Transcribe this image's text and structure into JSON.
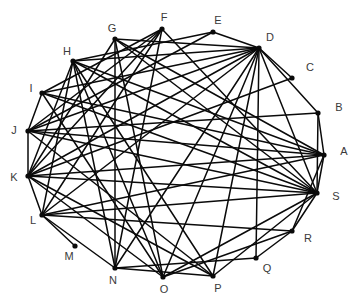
{
  "figure": {
    "title_fragment": "",
    "background_color": "#ffffff",
    "edge_color": "#0a0a0a",
    "node_color": "#0a0a0a",
    "label_color": "#3a3a3a"
  },
  "chart_data": {
    "type": "diagram",
    "subtype": "node-link-graph",
    "layout": "circular",
    "title": "",
    "xlabel": "",
    "ylabel": "",
    "grid": false,
    "legend": null,
    "node_count": 19,
    "edge_count": 60,
    "nodes": [
      {
        "id": "A",
        "label": "A",
        "x": 324,
        "y": 155,
        "label_x": 344,
        "label_y": 152
      },
      {
        "id": "B",
        "label": "B",
        "x": 318,
        "y": 113,
        "label_x": 339,
        "label_y": 108
      },
      {
        "id": "C",
        "label": "C",
        "x": 292,
        "y": 78,
        "label_x": 310,
        "label_y": 68
      },
      {
        "id": "D",
        "label": "D",
        "x": 259,
        "y": 48,
        "label_x": 270,
        "label_y": 38
      },
      {
        "id": "E",
        "label": "E",
        "x": 213,
        "y": 32,
        "label_x": 218,
        "label_y": 21
      },
      {
        "id": "F",
        "label": "F",
        "x": 162,
        "y": 29,
        "label_x": 164,
        "label_y": 18
      },
      {
        "id": "G",
        "label": "G",
        "x": 115,
        "y": 39,
        "label_x": 112,
        "label_y": 29
      },
      {
        "id": "H",
        "label": "H",
        "x": 73,
        "y": 61,
        "label_x": 67,
        "label_y": 52
      },
      {
        "id": "I",
        "label": "I",
        "x": 42,
        "y": 93,
        "label_x": 31,
        "label_y": 89
      },
      {
        "id": "J",
        "label": "J",
        "x": 28,
        "y": 131,
        "label_x": 14,
        "label_y": 131
      },
      {
        "id": "K",
        "label": "K",
        "x": 28,
        "y": 176,
        "label_x": 14,
        "label_y": 178
      },
      {
        "id": "L",
        "label": "L",
        "x": 42,
        "y": 215,
        "label_x": 33,
        "label_y": 221
      },
      {
        "id": "M",
        "label": "M",
        "x": 75,
        "y": 246,
        "label_x": 69,
        "label_y": 257
      },
      {
        "id": "N",
        "label": "N",
        "x": 115,
        "y": 268,
        "label_x": 113,
        "label_y": 281
      },
      {
        "id": "O",
        "label": "O",
        "x": 163,
        "y": 277,
        "label_x": 164,
        "label_y": 290
      },
      {
        "id": "P",
        "label": "P",
        "x": 213,
        "y": 276,
        "label_x": 218,
        "label_y": 289
      },
      {
        "id": "Q",
        "label": "Q",
        "x": 256,
        "y": 258,
        "label_x": 267,
        "label_y": 269
      },
      {
        "id": "R",
        "label": "R",
        "x": 292,
        "y": 231,
        "label_x": 308,
        "label_y": 239
      },
      {
        "id": "S",
        "label": "S",
        "x": 317,
        "y": 193,
        "label_x": 336,
        "label_y": 197
      }
    ],
    "edges": [
      [
        "A",
        "B"
      ],
      [
        "A",
        "S"
      ],
      [
        "A",
        "K"
      ],
      [
        "A",
        "J"
      ],
      [
        "A",
        "H"
      ],
      [
        "A",
        "G"
      ],
      [
        "A",
        "I"
      ],
      [
        "A",
        "L"
      ],
      [
        "A",
        "R"
      ],
      [
        "B",
        "S"
      ],
      [
        "B",
        "D"
      ],
      [
        "B",
        "J"
      ],
      [
        "C",
        "D"
      ],
      [
        "C",
        "K"
      ],
      [
        "D",
        "E"
      ],
      [
        "D",
        "S"
      ],
      [
        "D",
        "Q"
      ],
      [
        "D",
        "O"
      ],
      [
        "D",
        "P"
      ],
      [
        "D",
        "N"
      ],
      [
        "D",
        "L"
      ],
      [
        "D",
        "K"
      ],
      [
        "D",
        "J"
      ],
      [
        "D",
        "I"
      ],
      [
        "D",
        "H"
      ],
      [
        "D",
        "G"
      ],
      [
        "E",
        "H"
      ],
      [
        "E",
        "J"
      ],
      [
        "F",
        "S"
      ],
      [
        "F",
        "K"
      ],
      [
        "F",
        "J"
      ],
      [
        "F",
        "I"
      ],
      [
        "F",
        "L"
      ],
      [
        "F",
        "N"
      ],
      [
        "G",
        "S"
      ],
      [
        "G",
        "O"
      ],
      [
        "G",
        "N"
      ],
      [
        "G",
        "K"
      ],
      [
        "H",
        "S"
      ],
      [
        "H",
        "P"
      ],
      [
        "H",
        "O"
      ],
      [
        "H",
        "N"
      ],
      [
        "H",
        "K"
      ],
      [
        "H",
        "L"
      ],
      [
        "I",
        "S"
      ],
      [
        "I",
        "J"
      ],
      [
        "I",
        "O"
      ],
      [
        "J",
        "K"
      ],
      [
        "J",
        "S"
      ],
      [
        "J",
        "P"
      ],
      [
        "K",
        "L"
      ],
      [
        "K",
        "S"
      ],
      [
        "K",
        "O"
      ],
      [
        "K",
        "P"
      ],
      [
        "L",
        "M"
      ],
      [
        "L",
        "N"
      ],
      [
        "L",
        "R"
      ],
      [
        "L",
        "S"
      ],
      [
        "N",
        "Q"
      ],
      [
        "N",
        "P"
      ],
      [
        "O",
        "S"
      ],
      [
        "O",
        "R"
      ],
      [
        "P",
        "S"
      ],
      [
        "Q",
        "R"
      ],
      [
        "R",
        "S"
      ]
    ]
  }
}
